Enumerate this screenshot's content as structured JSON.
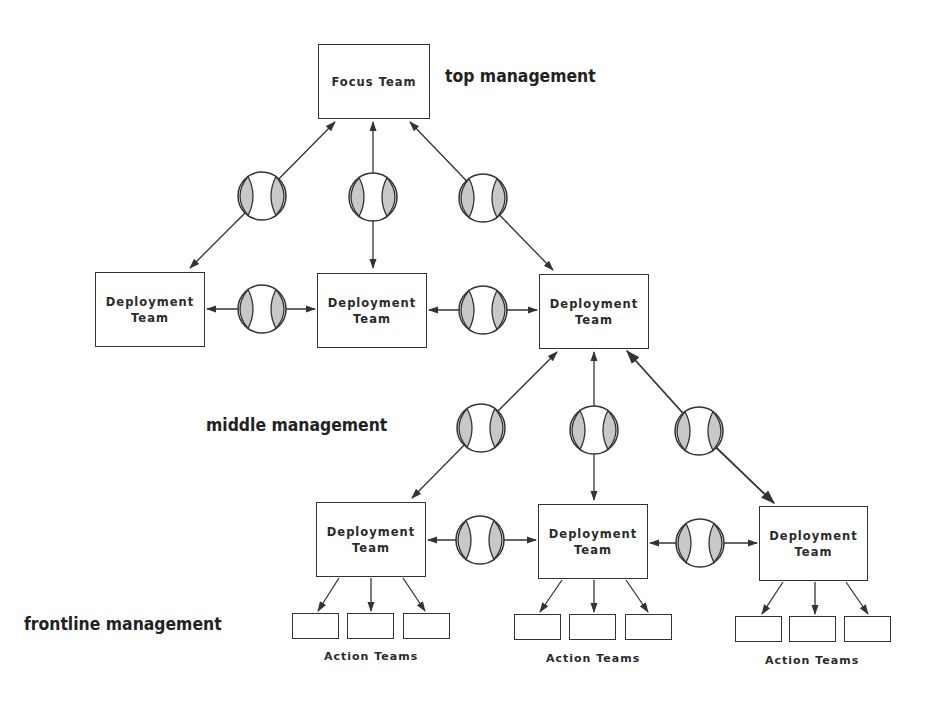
{
  "diagram": {
    "levels": {
      "top": "top management",
      "middle": "middle management",
      "frontline": "frontline management"
    },
    "focus_team": {
      "label": "Focus Team"
    },
    "deployment_teams_upper": [
      {
        "label": "Deployment\nTeam"
      },
      {
        "label": "Deployment\nTeam"
      },
      {
        "label": "Deployment\nTeam"
      }
    ],
    "deployment_teams_lower": [
      {
        "label": "Deployment\nTeam"
      },
      {
        "label": "Deployment\nTeam"
      },
      {
        "label": "Deployment\nTeam"
      }
    ],
    "action_team_groups": [
      {
        "label": "Action Teams",
        "count": 3
      },
      {
        "label": "Action Teams",
        "count": 3
      },
      {
        "label": "Action Teams",
        "count": 3
      }
    ],
    "connector_icon": "ball-connector-icon",
    "colors": {
      "line": "#333333",
      "shade": "#c8c8c8",
      "text": "#222222"
    }
  }
}
